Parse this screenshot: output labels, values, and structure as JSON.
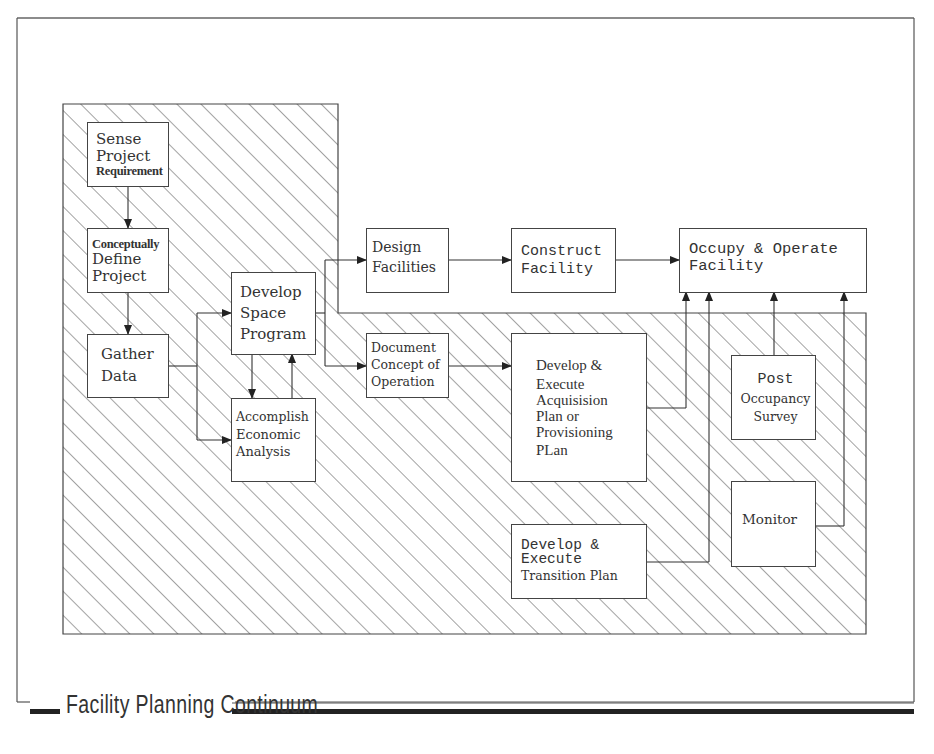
{
  "diagram": {
    "title": "Facility Planning Continuum",
    "colors": {
      "line": "#444444",
      "hatch": "#555555",
      "background": "#ffffff"
    },
    "nodes": [
      {
        "id": "sense",
        "lines": [
          "Sense",
          "Project",
          "Requirement"
        ]
      },
      {
        "id": "define",
        "lines": [
          "Conceptually",
          "Define",
          "Project"
        ]
      },
      {
        "id": "gather",
        "lines": [
          "Gather",
          "Data"
        ]
      },
      {
        "id": "space",
        "lines": [
          "Develop",
          "Space",
          "Program"
        ]
      },
      {
        "id": "econ",
        "lines": [
          "Accomplish",
          "Economic",
          "Analysis"
        ]
      },
      {
        "id": "design",
        "lines": [
          "Design",
          "Facilities"
        ]
      },
      {
        "id": "document",
        "lines": [
          "Document",
          "Concept of",
          "Operation"
        ]
      },
      {
        "id": "construct",
        "lines": [
          "Construct",
          "Facility"
        ]
      },
      {
        "id": "occupy",
        "lines": [
          "Occupy & Operate",
          "Facility"
        ]
      },
      {
        "id": "acquisition",
        "lines": [
          "Develop &",
          "Execute",
          "Acquisision",
          "Plan or",
          "Provisioning",
          "PLan"
        ]
      },
      {
        "id": "post",
        "lines": [
          "Post",
          "Occupancy",
          "Survey"
        ]
      },
      {
        "id": "monitor",
        "lines": [
          "Monitor"
        ]
      },
      {
        "id": "transition",
        "lines": [
          "Develop &",
          "Execute",
          "Transition Plan"
        ]
      }
    ],
    "edges": [
      {
        "from": "sense",
        "to": "define"
      },
      {
        "from": "define",
        "to": "gather"
      },
      {
        "from": "gather",
        "to": "space"
      },
      {
        "from": "gather",
        "to": "econ"
      },
      {
        "from": "space",
        "to": "econ"
      },
      {
        "from": "econ",
        "to": "space"
      },
      {
        "from": "space",
        "to": "design"
      },
      {
        "from": "space",
        "to": "document"
      },
      {
        "from": "design",
        "to": "construct"
      },
      {
        "from": "construct",
        "to": "occupy"
      },
      {
        "from": "document",
        "to": "acquisition"
      },
      {
        "from": "acquisition",
        "to": "occupy"
      },
      {
        "from": "transition",
        "to": "occupy"
      },
      {
        "from": "post",
        "to": "occupy"
      },
      {
        "from": "monitor",
        "to": "occupy"
      }
    ]
  }
}
